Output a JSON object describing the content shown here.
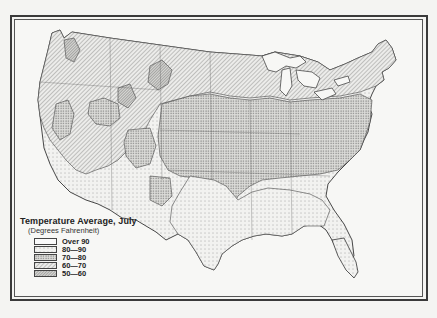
{
  "map": {
    "subject": "United States July average temperature",
    "legend": {
      "title": "Temperature Average, July",
      "subtitle": "(Degrees Fahrenheit)",
      "items": [
        {
          "label": "Over 90",
          "pattern": "blank",
          "fill": "#fafafa"
        },
        {
          "label": "80—90",
          "pattern": "sparse-dots",
          "fill": "#ededeb"
        },
        {
          "label": "70—80",
          "pattern": "dense-dots",
          "fill": "#c9c9c6"
        },
        {
          "label": "60—70",
          "pattern": "diagonal-hatch",
          "fill": "#d6d6d3"
        },
        {
          "label": "50—60",
          "pattern": "dense-diagonal-hatch",
          "fill": "#bcbcb8"
        }
      ]
    }
  }
}
